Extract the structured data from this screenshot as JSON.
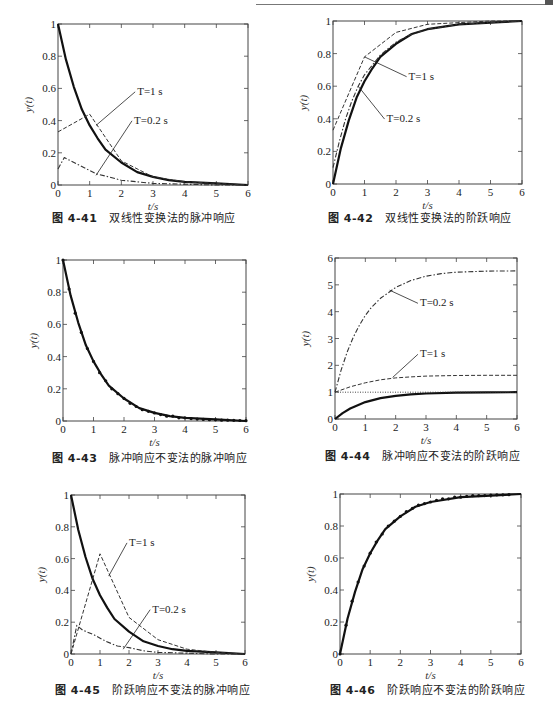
{
  "page": {
    "header_text": "第4章 数字滤波器设计"
  },
  "chart_data": [
    {
      "id": "fig-4-41",
      "type": "line",
      "caption_number": "图 4-41",
      "caption_text": "双线性变换法的脉冲响应",
      "title": "双线性变换法的脉冲响应",
      "xlabel": "t/s",
      "ylabel": "y(t)",
      "xlim": [
        0,
        6
      ],
      "ylim": [
        0,
        1
      ],
      "xticks": [
        0,
        1,
        2,
        3,
        4,
        5,
        6
      ],
      "yticks": [
        0,
        0.2,
        0.4,
        0.6,
        0.8,
        1
      ],
      "ytick_labels": [
        "0",
        "0.2",
        "0.4",
        "0.6",
        "0.8",
        "1"
      ],
      "grid": false,
      "series": [
        {
          "name": "continuous",
          "style": "solid-thick",
          "x": [
            0,
            0.25,
            0.5,
            0.75,
            1,
            1.25,
            1.5,
            2,
            2.5,
            3,
            3.5,
            4,
            5,
            6
          ],
          "y": [
            1,
            0.78,
            0.61,
            0.47,
            0.37,
            0.29,
            0.22,
            0.14,
            0.08,
            0.05,
            0.03,
            0.02,
            0.01,
            0.0
          ]
        },
        {
          "name": "T=1 s",
          "style": "dashed",
          "x": [
            0,
            1,
            2,
            3,
            4,
            5,
            6
          ],
          "y": [
            0.33,
            0.44,
            0.15,
            0.05,
            0.02,
            0.01,
            0.0
          ]
        },
        {
          "name": "T=0.2 s",
          "style": "dash-dot",
          "x": [
            0,
            0.2,
            0.4,
            0.8,
            1.2,
            1.6,
            2,
            2.5,
            3,
            4,
            5,
            6
          ],
          "y": [
            0.1,
            0.17,
            0.15,
            0.11,
            0.07,
            0.05,
            0.03,
            0.02,
            0.01,
            0.005,
            0.0,
            0.0
          ]
        }
      ],
      "annotations": [
        {
          "text": "T=1 s",
          "text_at": [
            2.5,
            0.56
          ],
          "points_to": [
            1.2,
            0.37
          ]
        },
        {
          "text": "T=0.2 s",
          "text_at": [
            2.4,
            0.38
          ],
          "points_to": [
            1.2,
            0.06
          ]
        }
      ]
    },
    {
      "id": "fig-4-42",
      "type": "line",
      "caption_number": "图 4-42",
      "caption_text": "双线性变换法的阶跃响应",
      "title": "双线性变换法的阶跃响应",
      "xlabel": "t/s",
      "ylabel": "y(t)",
      "xlim": [
        0,
        6
      ],
      "ylim": [
        0,
        1
      ],
      "xticks": [
        0,
        1,
        2,
        3,
        4,
        5,
        6
      ],
      "yticks": [
        0,
        0.2,
        0.4,
        0.6,
        0.8,
        1
      ],
      "ytick_labels": [
        "0",
        "0.2",
        "0.4",
        "0.6",
        "0.8",
        "1"
      ],
      "grid": false,
      "series": [
        {
          "name": "continuous",
          "style": "solid-thick",
          "x": [
            0,
            0.25,
            0.5,
            0.75,
            1,
            1.25,
            1.5,
            2,
            2.5,
            3,
            4,
            5,
            6
          ],
          "y": [
            0,
            0.22,
            0.39,
            0.53,
            0.63,
            0.71,
            0.78,
            0.86,
            0.92,
            0.95,
            0.98,
            0.99,
            1.0
          ]
        },
        {
          "name": "T=1 s",
          "style": "dashed",
          "x": [
            0,
            1,
            2,
            3,
            4,
            5,
            6
          ],
          "y": [
            0.33,
            0.78,
            0.93,
            0.98,
            0.99,
            1.0,
            1.0
          ]
        },
        {
          "name": "T=0.2 s",
          "style": "dash-dot",
          "x": [
            0,
            0.2,
            0.4,
            0.6,
            0.8,
            1,
            1.5,
            2,
            2.5,
            3,
            4,
            5,
            6
          ],
          "y": [
            0.1,
            0.26,
            0.4,
            0.51,
            0.6,
            0.67,
            0.79,
            0.87,
            0.92,
            0.95,
            0.98,
            0.99,
            1.0
          ]
        }
      ],
      "annotations": [
        {
          "text": "T=1 s",
          "text_at": [
            2.4,
            0.64
          ],
          "points_to": [
            1.0,
            0.78
          ]
        },
        {
          "text": "T=0.2 s",
          "text_at": [
            1.7,
            0.38
          ],
          "points_to": [
            0.8,
            0.6
          ]
        }
      ]
    },
    {
      "id": "fig-4-43",
      "type": "line",
      "caption_number": "图 4-43",
      "caption_text": "脉冲响应不变法的脉冲响应",
      "title": "脉冲响应不变法的脉冲响应",
      "xlabel": "t/s",
      "ylabel": "y(t)",
      "xlim": [
        0,
        6
      ],
      "ylim": [
        0,
        1
      ],
      "xticks": [
        0,
        1,
        2,
        3,
        4,
        5,
        6
      ],
      "yticks": [
        0,
        0.2,
        0.4,
        0.6,
        0.8,
        1
      ],
      "ytick_labels": [
        "0",
        "0.2",
        "0.4",
        "0.6",
        "0.8",
        "1"
      ],
      "grid": false,
      "series": [
        {
          "name": "continuous",
          "style": "solid-thick",
          "x": [
            0,
            0.25,
            0.5,
            0.75,
            1,
            1.25,
            1.5,
            2,
            2.5,
            3,
            3.5,
            4,
            5,
            6
          ],
          "y": [
            1,
            0.78,
            0.61,
            0.47,
            0.37,
            0.29,
            0.22,
            0.14,
            0.08,
            0.05,
            0.03,
            0.02,
            0.01,
            0.0
          ]
        },
        {
          "name": "discrete samples",
          "style": "markers",
          "x": [
            0,
            0.2,
            0.4,
            0.6,
            0.8,
            1.0,
            1.2,
            1.4,
            1.6,
            1.8,
            2.0,
            2.2,
            2.4,
            2.6,
            2.8,
            3.0,
            3.2,
            3.4,
            3.6,
            3.8,
            4.0,
            4.2,
            4.4,
            4.6,
            4.8,
            5.0,
            5.2,
            5.4,
            5.6,
            5.8,
            6.0
          ],
          "y": [
            1.0,
            0.82,
            0.67,
            0.55,
            0.45,
            0.37,
            0.3,
            0.25,
            0.2,
            0.17,
            0.14,
            0.11,
            0.09,
            0.07,
            0.06,
            0.05,
            0.04,
            0.03,
            0.03,
            0.02,
            0.02,
            0.015,
            0.012,
            0.01,
            0.008,
            0.007,
            0.005,
            0.005,
            0.004,
            0.003,
            0.002
          ]
        }
      ],
      "annotations": []
    },
    {
      "id": "fig-4-44",
      "type": "line",
      "caption_number": "图 4-44",
      "caption_text": "脉冲响应不变法的阶跃响应",
      "title": "脉冲响应不变法的阶跃响应",
      "xlabel": "t/s",
      "ylabel": "y(t)",
      "xlim": [
        0,
        6
      ],
      "ylim": [
        0,
        6
      ],
      "xticks": [
        0,
        1,
        2,
        3,
        4,
        5,
        6
      ],
      "yticks": [
        0,
        1,
        2,
        3,
        4,
        5,
        6
      ],
      "ytick_labels": [
        "0",
        "1",
        "2",
        "3",
        "4",
        "5",
        "6"
      ],
      "grid": false,
      "series": [
        {
          "name": "continuous",
          "style": "solid-thick",
          "x": [
            0,
            0.25,
            0.5,
            1,
            1.5,
            2,
            2.5,
            3,
            4,
            5,
            6
          ],
          "y": [
            0,
            0.22,
            0.39,
            0.63,
            0.78,
            0.86,
            0.92,
            0.95,
            0.98,
            0.99,
            1.0
          ]
        },
        {
          "name": "reference y=1",
          "style": "dotted",
          "x": [
            0,
            6
          ],
          "y": [
            1,
            1
          ]
        },
        {
          "name": "T=1 s",
          "style": "dashed",
          "x": [
            0,
            0.5,
            1,
            1.5,
            2,
            2.5,
            3,
            4,
            5,
            6
          ],
          "y": [
            1.0,
            1.2,
            1.35,
            1.46,
            1.53,
            1.57,
            1.6,
            1.62,
            1.63,
            1.63
          ]
        },
        {
          "name": "T=0.2 s",
          "style": "dash-dot",
          "x": [
            0,
            0.2,
            0.4,
            0.6,
            0.8,
            1,
            1.2,
            1.5,
            2,
            2.5,
            3,
            3.5,
            4,
            5,
            6
          ],
          "y": [
            1.0,
            1.82,
            2.49,
            3.04,
            3.49,
            3.86,
            4.16,
            4.5,
            4.9,
            5.16,
            5.32,
            5.42,
            5.47,
            5.51,
            5.52
          ]
        }
      ],
      "annotations": [
        {
          "text": "T=0.2 s",
          "text_at": [
            2.8,
            4.2
          ],
          "points_to": [
            1.8,
            4.8
          ]
        },
        {
          "text": "T=1 s",
          "text_at": [
            2.8,
            2.3
          ],
          "points_to": [
            1.9,
            1.55
          ]
        }
      ]
    },
    {
      "id": "fig-4-45",
      "type": "line",
      "caption_number": "图 4-45",
      "caption_text": "阶跃响应不变法的脉冲响应",
      "title": "阶跃响应不变法的脉冲响应",
      "xlabel": "t/s",
      "ylabel": "y(t)",
      "xlim": [
        0,
        6
      ],
      "ylim": [
        0,
        1
      ],
      "xticks": [
        0,
        1,
        2,
        3,
        4,
        5,
        6
      ],
      "yticks": [
        0,
        0.2,
        0.4,
        0.6,
        0.8,
        1
      ],
      "ytick_labels": [
        "0",
        "0.2",
        "0.4",
        "0.6",
        "0.8",
        "1"
      ],
      "grid": false,
      "series": [
        {
          "name": "continuous",
          "style": "solid-thick",
          "x": [
            0,
            0.25,
            0.5,
            0.75,
            1,
            1.25,
            1.5,
            2,
            2.5,
            3,
            3.5,
            4,
            5,
            6
          ],
          "y": [
            1,
            0.78,
            0.61,
            0.47,
            0.37,
            0.29,
            0.22,
            0.14,
            0.08,
            0.05,
            0.03,
            0.02,
            0.01,
            0.0
          ]
        },
        {
          "name": "T=1 s",
          "style": "dashed",
          "x": [
            0,
            1,
            2,
            3,
            4,
            5,
            6
          ],
          "y": [
            0.0,
            0.63,
            0.23,
            0.09,
            0.03,
            0.01,
            0.0
          ]
        },
        {
          "name": "T=0.2 s",
          "style": "dash-dot",
          "x": [
            0,
            0.2,
            0.4,
            0.8,
            1.2,
            1.6,
            2,
            2.5,
            3,
            4,
            5,
            6
          ],
          "y": [
            0.0,
            0.18,
            0.15,
            0.12,
            0.08,
            0.05,
            0.04,
            0.02,
            0.01,
            0.005,
            0.0,
            0.0
          ]
        }
      ],
      "annotations": [
        {
          "text": "T=1 s",
          "text_at": [
            2.0,
            0.68
          ],
          "points_to": [
            1.3,
            0.49
          ]
        },
        {
          "text": "T=0.2 s",
          "text_at": [
            2.8,
            0.26
          ],
          "points_to": [
            1.8,
            0.03
          ]
        }
      ]
    },
    {
      "id": "fig-4-46",
      "type": "line",
      "caption_number": "图 4-46",
      "caption_text": "阶跃响应不变法的阶跃响应",
      "title": "阶跃响应不变法的阶跃响应",
      "xlabel": "t/s",
      "ylabel": "y(t)",
      "xlim": [
        0,
        6
      ],
      "ylim": [
        0,
        1
      ],
      "xticks": [
        0,
        1,
        2,
        3,
        4,
        5,
        6
      ],
      "yticks": [
        0,
        0.2,
        0.4,
        0.6,
        0.8,
        1
      ],
      "ytick_labels": [
        "0",
        "0.2",
        "0.4",
        "0.6",
        "0.8",
        "1"
      ],
      "grid": false,
      "series": [
        {
          "name": "continuous",
          "style": "solid-thick",
          "x": [
            0,
            0.25,
            0.5,
            0.75,
            1,
            1.25,
            1.5,
            2,
            2.5,
            3,
            4,
            5,
            6
          ],
          "y": [
            0,
            0.22,
            0.39,
            0.53,
            0.63,
            0.71,
            0.78,
            0.86,
            0.92,
            0.95,
            0.98,
            0.99,
            1.0
          ]
        },
        {
          "name": "discrete samples",
          "style": "markers",
          "x": [
            0,
            0.2,
            0.4,
            0.6,
            0.8,
            1.0,
            1.2,
            1.4,
            1.6,
            1.8,
            2.0,
            2.2,
            2.4,
            2.6,
            2.8,
            3.0,
            3.2,
            3.4,
            3.6,
            3.8,
            4.0,
            4.2,
            4.4,
            4.6,
            4.8,
            5.0,
            5.2,
            5.4,
            5.6
          ],
          "y": [
            0.0,
            0.18,
            0.33,
            0.45,
            0.55,
            0.63,
            0.7,
            0.75,
            0.8,
            0.83,
            0.86,
            0.89,
            0.91,
            0.93,
            0.94,
            0.95,
            0.96,
            0.97,
            0.97,
            0.98,
            0.98,
            0.985,
            0.99,
            0.99,
            0.99,
            0.993,
            0.995,
            0.995,
            0.996
          ]
        }
      ],
      "annotations": []
    }
  ],
  "layout": {
    "frames": [
      {
        "left": 58,
        "top": 24,
        "right": 248,
        "bottom": 185,
        "caption_x": 52,
        "caption_y": 217
      },
      {
        "left": 333,
        "top": 21,
        "right": 522,
        "bottom": 184,
        "caption_x": 328,
        "caption_y": 217
      },
      {
        "left": 63,
        "top": 260,
        "right": 246,
        "bottom": 421,
        "caption_x": 52,
        "caption_y": 457
      },
      {
        "left": 335,
        "top": 258,
        "right": 517,
        "bottom": 419,
        "caption_x": 325,
        "caption_y": 455
      },
      {
        "left": 71,
        "top": 495,
        "right": 245,
        "bottom": 654,
        "caption_x": 55,
        "caption_y": 689
      },
      {
        "left": 340,
        "top": 494,
        "right": 521,
        "bottom": 654,
        "caption_x": 330,
        "caption_y": 689
      }
    ]
  }
}
